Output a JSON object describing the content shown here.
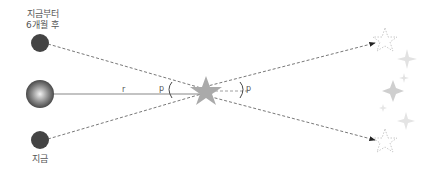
{
  "labels": {
    "earth_future_line1": "지금부터",
    "earth_future_line2": "6개월 후",
    "earth_now": "지금",
    "distance": "r",
    "parallax_left": "p",
    "parallax_right": "p"
  },
  "colors": {
    "earth": "#444444",
    "sun_center": "#eeeeee",
    "sun_edge": "#555555",
    "star": "#aaaaaa",
    "dashed_line": "#555555",
    "background_stars": "#dddddd"
  }
}
